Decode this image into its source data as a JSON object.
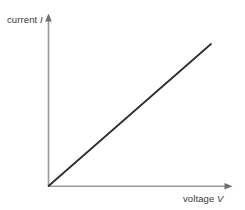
{
  "figure": {
    "background_color": "#ffffff",
    "axis_color": "#999999",
    "line_color": "#2b2b2b",
    "text_color": "#3a3a3a",
    "width": 245,
    "height": 210
  },
  "axes": {
    "y": {
      "label_text": "current",
      "label_symbol": "I",
      "name": "current",
      "arrow": "up"
    },
    "x": {
      "label_text": "voltage",
      "label_symbol": "V",
      "name": "voltage",
      "arrow": "right"
    }
  },
  "chart_data": {
    "type": "line",
    "title": "",
    "xlabel": "voltage V",
    "ylabel": "current I",
    "x": [
      0,
      1
    ],
    "series": [
      {
        "name": "current vs voltage",
        "values": [
          0,
          1
        ],
        "description": "straight line through the origin with constant positive gradient"
      }
    ],
    "xlim": [
      0,
      1.12
    ],
    "ylim": [
      0,
      1.18
    ],
    "grid": false,
    "legend": false,
    "tick_labels": {
      "x": [],
      "y": []
    },
    "annotations": []
  }
}
